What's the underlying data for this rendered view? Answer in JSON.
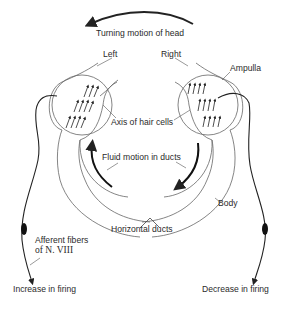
{
  "diagram": {
    "title": "Turning motion of head",
    "labels": {
      "turning_motion": "Turning motion of head",
      "left": "Left",
      "right": "Right",
      "ampulla": "Ampulla",
      "axis_hair_cells": "Axis of hair cells",
      "fluid_motion": "Fluid motion in ducts",
      "body": "Body",
      "horizontal_ducts": "Horizontal ducts",
      "afferent_line1": "Afferent fibers",
      "afferent_line2": "of N. VIII",
      "increase_firing": "Increase in firing",
      "decrease_firing": "Decrease in firing"
    },
    "colors": {
      "stroke": "#333333",
      "thin_stroke": "#555555",
      "text": "#2a2a2a"
    }
  }
}
